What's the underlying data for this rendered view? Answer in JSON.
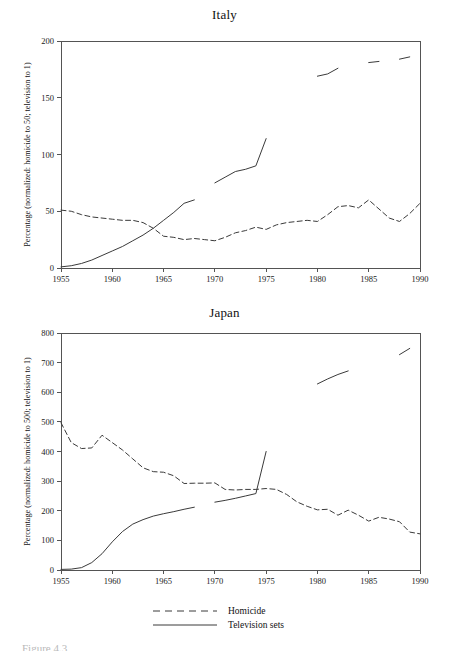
{
  "figure": {
    "caption_fragment": "Figure 4.3"
  },
  "legend": {
    "position": "bottom-center",
    "items": [
      {
        "label": "Homicide",
        "style": "dashed",
        "swatch": "dashed-line-swatch"
      },
      {
        "label": "Television sets",
        "style": "solid",
        "swatch": "solid-line-swatch"
      }
    ]
  },
  "chart_data": [
    {
      "type": "line",
      "title": "Italy",
      "xlabel": "",
      "ylabel": "Percentage (normalized: homicide to 50; television to 1)",
      "xlim": [
        1955,
        1990
      ],
      "ylim": [
        0,
        200
      ],
      "xticks": [
        1955,
        1960,
        1965,
        1970,
        1975,
        1980,
        1985,
        1990
      ],
      "yticks": [
        0,
        50,
        100,
        150,
        200
      ],
      "grid": false,
      "series": [
        {
          "name": "Homicide",
          "style": "dashed",
          "x": [
            1955,
            1956,
            1957,
            1958,
            1959,
            1960,
            1961,
            1962,
            1963,
            1964,
            1965,
            1966,
            1967,
            1968,
            1969,
            1970,
            1971,
            1972,
            1973,
            1974,
            1975,
            1976,
            1977,
            1978,
            1979,
            1980,
            1981,
            1982,
            1983,
            1984,
            1985,
            1986,
            1987,
            1988,
            1989,
            1990
          ],
          "values": [
            51,
            50,
            47,
            45,
            44,
            43,
            42,
            42,
            40,
            35,
            28,
            27,
            25,
            26,
            25,
            24,
            27,
            31,
            33,
            36,
            34,
            38,
            40,
            41,
            42,
            41,
            47,
            54,
            55,
            53,
            60,
            52,
            44,
            41,
            48,
            57,
            75
          ]
        },
        {
          "name": "Television sets",
          "style": "solid",
          "segments": [
            {
              "x": [
                1955,
                1956,
                1957,
                1958,
                1959,
                1960,
                1961,
                1962,
                1963,
                1964,
                1965,
                1966,
                1967,
                1968
              ],
              "values": [
                1,
                2,
                4,
                7,
                11,
                15,
                19,
                24,
                29,
                35,
                42,
                49,
                57,
                60
              ]
            },
            {
              "x": [
                1970,
                1971,
                1972,
                1973,
                1974,
                1975
              ],
              "values": [
                75,
                80,
                85,
                87,
                90,
                114
              ]
            },
            {
              "x": [
                1980,
                1981,
                1982
              ],
              "values": [
                169,
                171,
                176
              ]
            },
            {
              "x": [
                1985,
                1986
              ],
              "values": [
                181,
                182
              ]
            },
            {
              "x": [
                1988,
                1989
              ],
              "values": [
                184,
                186
              ]
            }
          ]
        }
      ]
    },
    {
      "type": "line",
      "title": "Japan",
      "xlabel": "",
      "ylabel": "Percentage (normalized: homicide to 500; television to 1)",
      "xlim": [
        1955,
        1990
      ],
      "ylim": [
        0,
        800
      ],
      "xticks": [
        1955,
        1960,
        1965,
        1970,
        1975,
        1980,
        1985,
        1990
      ],
      "yticks": [
        0,
        100,
        200,
        300,
        400,
        500,
        600,
        700,
        800
      ],
      "grid": false,
      "series": [
        {
          "name": "Homicide",
          "style": "dashed",
          "x": [
            1955,
            1956,
            1957,
            1958,
            1959,
            1960,
            1961,
            1962,
            1963,
            1964,
            1965,
            1966,
            1967,
            1968,
            1969,
            1970,
            1971,
            1972,
            1973,
            1974,
            1975,
            1976,
            1977,
            1978,
            1979,
            1980,
            1981,
            1982,
            1983,
            1984,
            1985,
            1986,
            1987,
            1988,
            1989,
            1990
          ],
          "values": [
            497,
            430,
            410,
            412,
            455,
            430,
            405,
            375,
            345,
            332,
            330,
            318,
            292,
            293,
            293,
            294,
            272,
            270,
            272,
            272,
            275,
            272,
            255,
            230,
            215,
            203,
            205,
            185,
            202,
            185,
            165,
            178,
            172,
            163,
            128,
            122,
            122
          ]
        },
        {
          "name": "Television sets",
          "style": "solid",
          "segments": [
            {
              "x": [
                1955,
                1956,
                1957,
                1958,
                1959,
                1960,
                1961,
                1962,
                1963,
                1964,
                1965,
                1966,
                1967,
                1968
              ],
              "values": [
                2,
                3,
                8,
                25,
                55,
                95,
                130,
                155,
                170,
                182,
                190,
                197,
                205,
                212
              ]
            },
            {
              "x": [
                1970,
                1971,
                1972,
                1973,
                1974,
                1975
              ],
              "values": [
                229,
                235,
                242,
                250,
                258,
                400
              ]
            },
            {
              "x": [
                1980,
                1981,
                1982,
                1983
              ],
              "values": [
                628,
                645,
                660,
                672
              ]
            },
            {
              "x": [
                1988,
                1989
              ],
              "values": [
                727,
                748
              ]
            }
          ]
        }
      ]
    }
  ]
}
